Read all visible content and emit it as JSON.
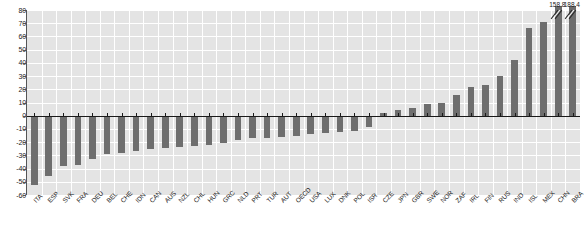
{
  "chart_data": {
    "type": "bar",
    "title": "",
    "subtitle": "",
    "xlabel": "",
    "ylabel": "",
    "ylim": [
      -60,
      80
    ],
    "ytick_step": 10,
    "grid": true,
    "legend": "none",
    "orientation": "vertical",
    "bar_color": "#6e6e6e",
    "plot_background": "#e4e4e4",
    "gridline_color": "#ffffff",
    "zero_line_color": "#1a1a1a",
    "yticks": [
      80,
      70,
      60,
      50,
      40,
      30,
      20,
      10,
      0,
      -10,
      -20,
      -30,
      -40,
      -50,
      -60
    ],
    "categories": [
      "ITA",
      "ESP",
      "SVK",
      "FRA",
      "DEU",
      "BEL",
      "CHE",
      "IDN",
      "CAN",
      "AUS",
      "NZL",
      "CHL",
      "HUN",
      "GRC",
      "NLD",
      "PRT",
      "TUR",
      "AUT",
      "OECD",
      "USA",
      "LUX",
      "DNK",
      "POL",
      "ISR",
      "CZE",
      "JPN",
      "GBR",
      "SWE",
      "NOR",
      "ZAF",
      "IRL",
      "FIN",
      "RUS",
      "IND",
      "ISL",
      "MEX",
      "CHN",
      "BRA"
    ],
    "values": [
      -52.5,
      -45.5,
      -38.0,
      -37.5,
      -32.5,
      -29.0,
      -28.5,
      -27.0,
      -25.5,
      -24.5,
      -24.0,
      -23.0,
      -22.5,
      -21.0,
      -18.5,
      -17.0,
      -16.5,
      -16.0,
      -15.5,
      -13.5,
      -13.0,
      -12.5,
      -11.5,
      -8.5,
      2.0,
      4.0,
      6.0,
      9.0,
      10.0,
      15.5,
      22.0,
      23.0,
      30.0,
      42.0,
      66.5,
      71.0,
      158.8,
      188.4
    ],
    "axis_break": {
      "applies_to": [
        "CHN",
        "BRA"
      ],
      "note": "bars truncated with break marks"
    },
    "data_labels": [
      {
        "category": "CHN",
        "text": "158.8"
      },
      {
        "category": "BRA",
        "text": "188.4"
      }
    ]
  }
}
